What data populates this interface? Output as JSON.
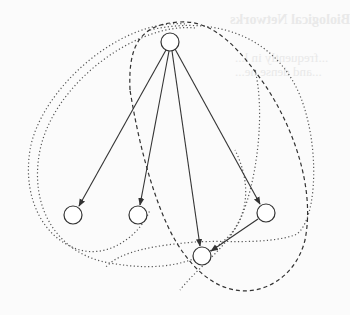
{
  "diagram": {
    "type": "directed-graph-with-hyperedges",
    "background_bleed_text": [
      "Biological Networks",
      "...frequently in l...",
      "...and dense ne..."
    ],
    "nodes": [
      {
        "id": "root",
        "label": ""
      },
      {
        "id": "leaf-a",
        "label": ""
      },
      {
        "id": "leaf-b",
        "label": ""
      },
      {
        "id": "leaf-c",
        "label": ""
      },
      {
        "id": "sink",
        "label": ""
      }
    ],
    "edges": [
      {
        "from": "root",
        "to": "leaf-a",
        "directed": true
      },
      {
        "from": "root",
        "to": "leaf-b",
        "directed": true
      },
      {
        "from": "root",
        "to": "sink",
        "directed": true
      },
      {
        "from": "root",
        "to": "leaf-c",
        "directed": true
      },
      {
        "from": "leaf-c",
        "to": "sink",
        "directed": true
      }
    ],
    "groupings": [
      {
        "id": "loop-1",
        "style": "dotted",
        "members": [
          "root",
          "leaf-a"
        ]
      },
      {
        "id": "loop-2",
        "style": "dotted",
        "members": [
          "root",
          "leaf-a",
          "leaf-b"
        ]
      },
      {
        "id": "loop-3",
        "style": "dotted",
        "members": [
          "root",
          "leaf-c",
          "sink"
        ]
      },
      {
        "id": "loop-4",
        "style": "dashed",
        "members": [
          "root",
          "sink"
        ]
      }
    ],
    "colors": {
      "stroke": "#333333",
      "node_fill": "#ffffff",
      "background": "#fbfbfb"
    }
  }
}
